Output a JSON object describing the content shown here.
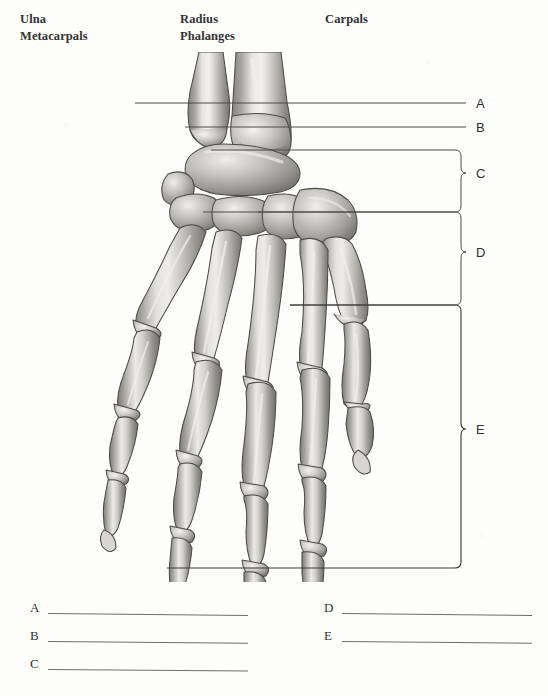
{
  "worksheet": {
    "title": "Bones of the Hand and Wrist Labeling Exercise",
    "subject": "hand-skeleton-posterior-view"
  },
  "word_bank": {
    "terms": [
      {
        "label": "Ulna",
        "x": 20,
        "y": 12
      },
      {
        "label": "Metacarpals",
        "x": 20,
        "y": 29
      },
      {
        "label": "Radius",
        "x": 180,
        "y": 12
      },
      {
        "label": "Phalanges",
        "x": 180,
        "y": 29
      },
      {
        "label": "Carpals",
        "x": 325,
        "y": 12
      }
    ]
  },
  "figure": {
    "caption": "Right hand skeleton, posterior (dorsal) view",
    "callouts": [
      {
        "letter": "A",
        "type": "line",
        "label_x": 476,
        "label_y": 96,
        "target": "ulna-shaft"
      },
      {
        "letter": "B",
        "type": "line",
        "label_x": 476,
        "label_y": 120,
        "target": "radius-distal-end"
      },
      {
        "letter": "C",
        "type": "bracket",
        "label_x": 476,
        "label_y": 173,
        "target": "carpals"
      },
      {
        "letter": "D",
        "type": "bracket",
        "label_x": 476,
        "label_y": 252,
        "target": "metacarpals"
      },
      {
        "letter": "E",
        "type": "bracket",
        "label_x": 476,
        "label_y": 429,
        "target": "phalanges"
      }
    ]
  },
  "answers": {
    "left_column": [
      {
        "letter": "A",
        "value": "",
        "x": 30,
        "y": 598,
        "line_width": 200
      },
      {
        "letter": "B",
        "value": "",
        "x": 30,
        "y": 626,
        "line_width": 200
      },
      {
        "letter": "C",
        "value": "",
        "x": 30,
        "y": 654,
        "line_width": 200
      }
    ],
    "right_column": [
      {
        "letter": "D",
        "value": "",
        "x": 324,
        "y": 598,
        "line_width": 190
      },
      {
        "letter": "E",
        "value": "",
        "x": 324,
        "y": 626,
        "line_width": 190
      }
    ]
  },
  "colors": {
    "paper": "#fdfdfc",
    "ink": "#333333",
    "rule": "#6d6d6d",
    "leader": "#4a4a4a",
    "bone_light": "#e9e8e4",
    "bone_mid": "#b5b3ae",
    "bone_dark": "#7b7974",
    "bone_outline": "#4d4b48"
  }
}
